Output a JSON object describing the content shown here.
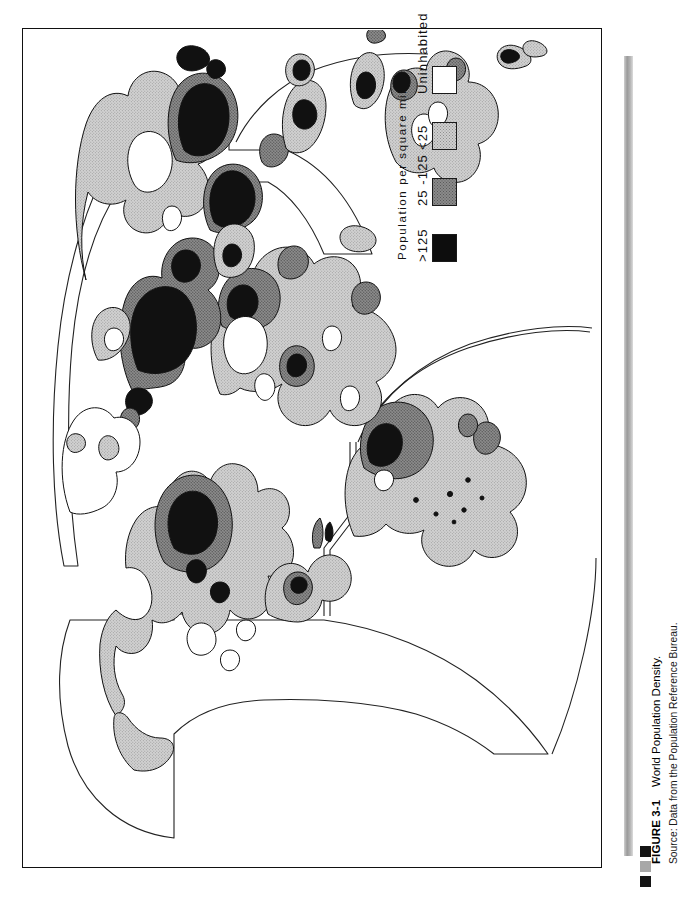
{
  "figure": {
    "label": "FIGURE 3-1",
    "title": "World Population Density.",
    "source": "Source: Data from the Population Reference Bureau.",
    "markers": [
      "dark",
      "gray",
      "dark"
    ],
    "accent_color": "#9a9a9a"
  },
  "legend": {
    "title": "Population  per  square  mile",
    "items": [
      {
        "label": ">125",
        "swatch": "black",
        "color": "#0d0d0d"
      },
      {
        "label": "25 -125",
        "swatch": "dark-gray",
        "color": "#8a8a8a"
      },
      {
        "label": "<25",
        "swatch": "light-gray",
        "color": "#cfcfcf"
      },
      {
        "label": "Uninhabited",
        "swatch": "white",
        "color": "#ffffff"
      }
    ]
  },
  "map": {
    "name": "world-population-density-map",
    "orientation": "rotated-90-ccw",
    "projection": "interrupted-goode-homolosine"
  }
}
